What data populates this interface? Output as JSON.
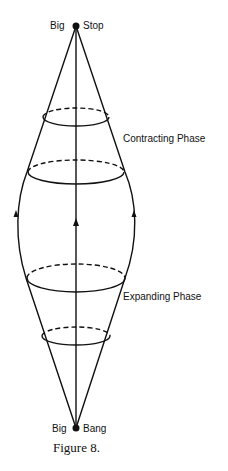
{
  "diagram": {
    "top_point": {
      "left_label": "Big",
      "right_label": "Stop"
    },
    "bottom_point": {
      "left_label": "Big",
      "right_label": "Bang"
    },
    "phases": {
      "contracting": "Contracting Phase",
      "expanding": "Expanding Phase"
    },
    "caption": "Figure 8.",
    "ellipses": [
      {
        "name": "upper-small",
        "cy": 117,
        "rx": 33,
        "ry": 9
      },
      {
        "name": "upper-large",
        "cy": 172,
        "rx": 48,
        "ry": 12
      },
      {
        "name": "lower-large",
        "cy": 278,
        "rx": 49,
        "ry": 14
      },
      {
        "name": "lower-small",
        "cy": 336,
        "rx": 35,
        "ry": 9
      }
    ],
    "arrows": [
      {
        "name": "left",
        "x": 16,
        "y": 214,
        "direction": "up"
      },
      {
        "name": "center",
        "x": 76,
        "y": 222,
        "direction": "up"
      },
      {
        "name": "right",
        "x": 134,
        "y": 214,
        "direction": "up"
      }
    ],
    "line_color": "#111111"
  }
}
